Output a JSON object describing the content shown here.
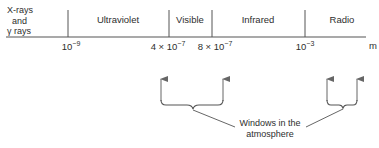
{
  "diagram": {
    "bands": [
      {
        "id": "xray",
        "line1": "X-rays",
        "line2": "and",
        "line3": "γ rays"
      },
      {
        "id": "uv",
        "label": "Ultraviolet"
      },
      {
        "id": "visible",
        "label": "Visible"
      },
      {
        "id": "ir",
        "label": "Infrared"
      },
      {
        "id": "radio",
        "label": "Radio"
      }
    ],
    "ticks": [
      {
        "base": "10",
        "exp": "−9"
      },
      {
        "base": "4 × 10",
        "exp": "−7"
      },
      {
        "base": "8 × 10",
        "exp": "−7"
      },
      {
        "base": "10",
        "exp": "−3"
      }
    ],
    "unit": "m",
    "caption": {
      "line1": "Windows in the",
      "line2": "atmosphere"
    },
    "colors": {
      "line": "#555555",
      "text": "#2e2e2e",
      "background": "#ffffff"
    }
  }
}
